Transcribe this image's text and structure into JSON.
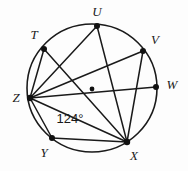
{
  "figure": {
    "kind": "circle-inscribed-polygon-diagram",
    "colors": {
      "background": "#fdfdfd",
      "stroke": "#1a1a1a",
      "dot": "#111111",
      "label": "#1a1a1a"
    },
    "circle": {
      "name": "main-circle",
      "cx": 92,
      "cy": 88,
      "rx": 65,
      "ry": 64,
      "stroke_width": 1.6
    },
    "center": {
      "name": "circle-center-dot",
      "cx": 92,
      "cy": 89,
      "r": 2.4
    },
    "points": [
      {
        "id": "T",
        "label": "T",
        "cx": 44,
        "cy": 49,
        "r": 3.0,
        "label_x": 34,
        "label_y": 36
      },
      {
        "id": "U",
        "label": "U",
        "cx": 97,
        "cy": 26,
        "r": 3.0,
        "label_x": 97,
        "label_y": 13
      },
      {
        "id": "V",
        "label": "V",
        "cx": 143,
        "cy": 51,
        "r": 3.0,
        "label_x": 155,
        "label_y": 41
      },
      {
        "id": "W",
        "label": "W",
        "cx": 156,
        "cy": 87,
        "r": 3.0,
        "label_x": 172,
        "label_y": 86
      },
      {
        "id": "X",
        "label": "X",
        "cx": 127,
        "cy": 142,
        "r": 3.2,
        "label_x": 134,
        "label_y": 157
      },
      {
        "id": "Y",
        "label": "Y",
        "cx": 52,
        "cy": 138,
        "r": 3.0,
        "label_x": 44,
        "label_y": 154
      },
      {
        "id": "Z",
        "label": "Z",
        "cx": 30,
        "cy": 98,
        "r": 3.2,
        "label_x": 16,
        "label_y": 99
      }
    ],
    "chords": [
      {
        "name": "chord-Z-T",
        "from": "Z",
        "to": "T",
        "x1": 30,
        "y1": 98,
        "x2": 44,
        "y2": 49
      },
      {
        "name": "chord-Z-U",
        "from": "Z",
        "to": "U",
        "x1": 30,
        "y1": 98,
        "x2": 97,
        "y2": 26
      },
      {
        "name": "chord-Z-V",
        "from": "Z",
        "to": "V",
        "x1": 30,
        "y1": 98,
        "x2": 143,
        "y2": 51
      },
      {
        "name": "chord-Z-W",
        "from": "Z",
        "to": "W",
        "x1": 30,
        "y1": 98,
        "x2": 156,
        "y2": 87
      },
      {
        "name": "chord-Z-X",
        "from": "Z",
        "to": "X",
        "x1": 30,
        "y1": 98,
        "x2": 127,
        "y2": 142
      },
      {
        "name": "chord-Z-Y",
        "from": "Z",
        "to": "Y",
        "x1": 30,
        "y1": 98,
        "x2": 52,
        "y2": 138
      },
      {
        "name": "chord-T-X",
        "from": "T",
        "to": "X",
        "x1": 44,
        "y1": 49,
        "x2": 127,
        "y2": 142
      },
      {
        "name": "chord-U-X",
        "from": "U",
        "to": "X",
        "x1": 97,
        "y1": 26,
        "x2": 127,
        "y2": 142
      },
      {
        "name": "chord-V-X",
        "from": "V",
        "to": "X",
        "x1": 143,
        "y1": 51,
        "x2": 127,
        "y2": 142
      },
      {
        "name": "chord-Y-X",
        "from": "Y",
        "to": "X",
        "x1": 52,
        "y1": 138,
        "x2": 127,
        "y2": 142
      }
    ],
    "angle_annotations": [
      {
        "name": "angle-label-124",
        "text": "124°",
        "value": 124,
        "unit": "degrees",
        "x": 70,
        "y": 120
      }
    ]
  }
}
